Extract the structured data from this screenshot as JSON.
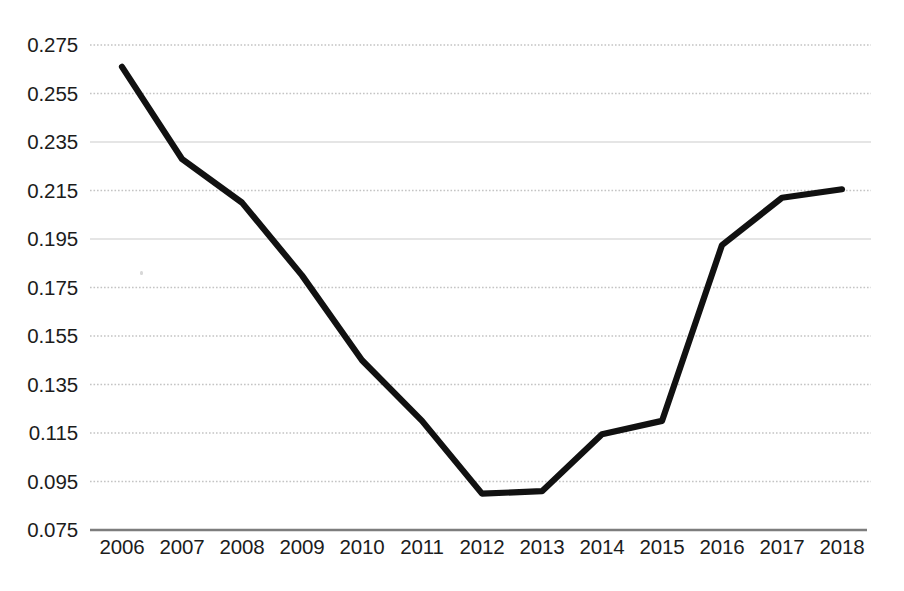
{
  "chart_data": {
    "type": "line",
    "title": "",
    "subtitle": "",
    "xlabel": "",
    "ylabel": "",
    "categories": [
      "2006",
      "2007",
      "2008",
      "2009",
      "2010",
      "2011",
      "2012",
      "2013",
      "2014",
      "2015",
      "2016",
      "2017",
      "2018"
    ],
    "values": [
      0.266,
      0.228,
      0.21,
      0.18,
      0.145,
      0.12,
      0.09,
      0.091,
      0.1145,
      0.12,
      0.1925,
      0.212,
      0.2155
    ],
    "series": [
      {
        "name": "",
        "values": [
          0.266,
          0.228,
          0.21,
          0.18,
          0.145,
          0.12,
          0.09,
          0.091,
          0.1145,
          0.12,
          0.1925,
          0.212,
          0.2155
        ]
      }
    ],
    "x": [
      "2006",
      "2007",
      "2008",
      "2009",
      "2010",
      "2011",
      "2012",
      "2013",
      "2014",
      "2015",
      "2016",
      "2017",
      "2018"
    ],
    "ylim": [
      0.075,
      0.275
    ],
    "xlim": [
      "2006",
      "2018"
    ],
    "y_ticks": [
      0.275,
      0.255,
      0.235,
      0.215,
      0.195,
      0.175,
      0.155,
      0.135,
      0.115,
      0.095,
      0.075
    ],
    "y_tick_labels": [
      "0.275",
      "0.255",
      "0.235",
      "0.215",
      "0.195",
      "0.175",
      "0.155",
      "0.135",
      "0.115",
      "0.095",
      "0.075"
    ],
    "x_tick_labels": [
      "2006",
      "2007",
      "2008",
      "2009",
      "2010",
      "2011",
      "2012",
      "2013",
      "2014",
      "2015",
      "2016",
      "2017",
      "2018"
    ],
    "grid": true,
    "grid_orientation": "horizontal",
    "grid_style": "dotted",
    "legend": false,
    "legend_position": "none",
    "annotations": [],
    "colors": {
      "line": "#111111",
      "grid": "#d0d0d0",
      "axis": "#808080",
      "text": "#1c1c1c",
      "background": "#ffffff"
    },
    "line_width_px": 6,
    "markers": false
  },
  "axes": {
    "y": {
      "ticks": [
        "0.275",
        "0.255",
        "0.235",
        "0.215",
        "0.195",
        "0.175",
        "0.155",
        "0.135",
        "0.115",
        "0.095",
        "0.075"
      ]
    },
    "x": {
      "ticks": [
        "2006",
        "2007",
        "2008",
        "2009",
        "2010",
        "2011",
        "2012",
        "2013",
        "2014",
        "2015",
        "2016",
        "2017",
        "2018"
      ]
    }
  }
}
